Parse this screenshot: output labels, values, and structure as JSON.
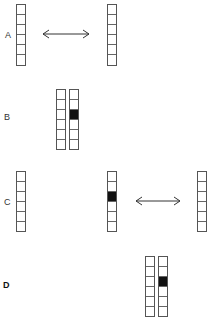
{
  "rows": [
    {
      "label": "A"
    },
    {
      "label": "B"
    },
    {
      "label": "C"
    },
    {
      "label": "D"
    }
  ],
  "colors": {
    "filled": "#111111",
    "stroke": "#555555"
  },
  "cells_per_column": 6,
  "filled_cell_index": 2
}
